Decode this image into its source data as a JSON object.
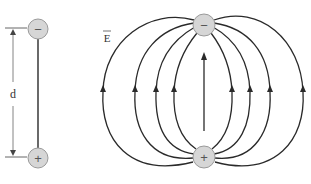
{
  "diagram": {
    "colors": {
      "line": "#2a2a2a",
      "charge_fill": "#d6d6d6",
      "charge_stroke": "#9a9a9a",
      "label": "#333333",
      "background": "#ffffff"
    },
    "left_dipole": {
      "negative_charge": {
        "symbol": "−",
        "cx": 38,
        "cy": 29,
        "r": 10
      },
      "positive_charge": {
        "symbol": "+",
        "cx": 38,
        "cy": 158,
        "r": 10
      },
      "separation_label": "d"
    },
    "field_diagram": {
      "field_label": "E",
      "field_label_vector_arrow": true,
      "negative_charge": {
        "symbol": "−",
        "cx": 204,
        "cy": 25,
        "r": 11
      },
      "positive_charge": {
        "symbol": "+",
        "cx": 204,
        "cy": 157,
        "r": 11
      },
      "field_line_count": 9,
      "arrow_direction": "from + to − (upward)"
    }
  }
}
